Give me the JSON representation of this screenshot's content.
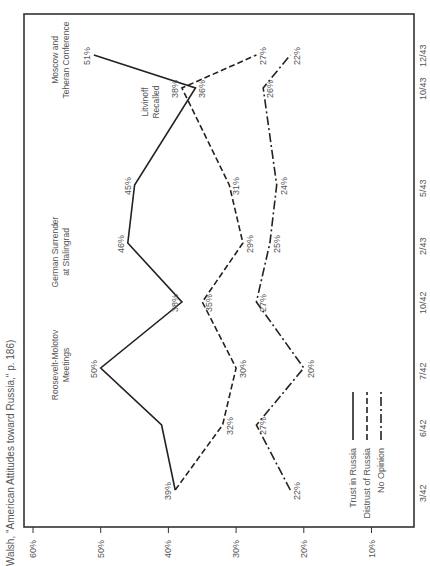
{
  "caption": "Walsh, \"American Attitudes toward Russia,\" p. 186)",
  "legend": {
    "trust": "Trust in Russia",
    "distrust": "Distrust of Russia",
    "no_opinion": "No Opinion"
  },
  "events": {
    "roosevelt": [
      "Roosevelt-Molotov",
      "Meetings"
    ],
    "stalingrad": [
      "German Surrender",
      "at Stalingrad"
    ],
    "litvinoff": [
      "Litvinoff",
      "Recalled"
    ],
    "moscow": [
      "Moscow and",
      "Teheran Conference"
    ]
  },
  "chart_data": {
    "type": "line",
    "title": "",
    "orientation": "rotated 90° (time runs bottom-to-top along right edge; percent runs left-to-right along bottom edge, 60% at left)",
    "x": [
      "3/42",
      "6/42",
      "7/42",
      "10/42",
      "2/43",
      "5/43",
      "10/43",
      "12/43"
    ],
    "xlabel": "",
    "ylabel": "",
    "yticks": [
      "60%",
      "50%",
      "40%",
      "30%",
      "20%",
      "10%"
    ],
    "ylim": [
      5,
      60
    ],
    "grid": false,
    "series": [
      {
        "name": "Trust in Russia",
        "style": "solid",
        "values": [
          39,
          41,
          50,
          38,
          46,
          45,
          36,
          51
        ],
        "labels": [
          "39%",
          "",
          "50%",
          "38%",
          "46%",
          "45%",
          "36%",
          "51%"
        ]
      },
      {
        "name": "Distrust of Russia",
        "style": "dashed",
        "values": [
          39,
          32,
          30,
          35,
          29,
          31,
          38,
          27
        ],
        "labels": [
          "",
          "32%",
          "30%",
          "35%",
          "29%",
          "31%",
          "38%",
          "27%"
        ]
      },
      {
        "name": "No Opinion",
        "style": "dash-dot",
        "values": [
          22,
          27,
          20,
          27,
          25,
          24,
          26,
          22
        ],
        "labels": [
          "22%",
          "27%",
          "20%",
          "27%",
          "25%",
          "24%",
          "26%",
          "22%"
        ]
      }
    ],
    "annotations": [
      {
        "at": "7/42",
        "text": "Roosevelt-Molotov Meetings"
      },
      {
        "at": "2/43",
        "text": "German Surrender at Stalingrad"
      },
      {
        "at": "10/43",
        "text": "Litvinoff Recalled"
      },
      {
        "at": "12/43",
        "text": "Moscow and Teheran Conference"
      }
    ],
    "legend_position": "lower right (rotated)"
  }
}
